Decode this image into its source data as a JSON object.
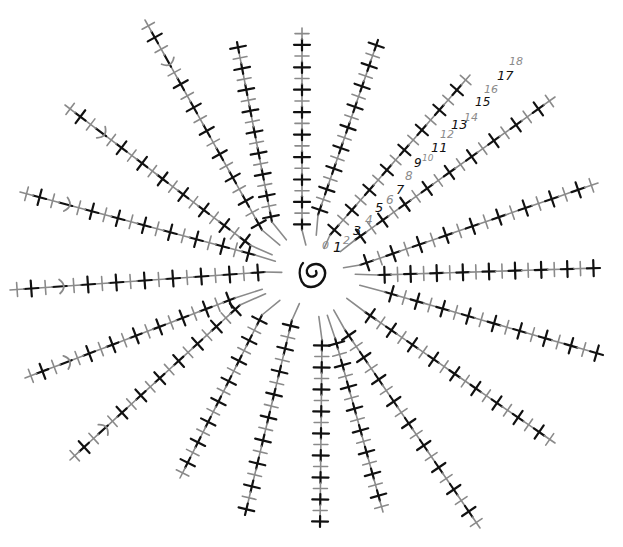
{
  "diagram": {
    "type": "crochet-chart",
    "center": {
      "x": 313,
      "y": 273,
      "symbol": "magic-ring"
    },
    "colors": {
      "odd_row": "#111111",
      "even_row": "#8a8a8a",
      "background": "#ffffff"
    },
    "row_labels": [
      {
        "text": "0",
        "x": 322,
        "y": 249,
        "size": 11,
        "row": 0
      },
      {
        "text": "1",
        "x": 333,
        "y": 252,
        "size": 14,
        "row": 1
      },
      {
        "text": "2",
        "x": 343,
        "y": 244,
        "size": 11,
        "row": 2
      },
      {
        "text": "3",
        "x": 353,
        "y": 235,
        "size": 13,
        "row": 3
      },
      {
        "text": "4",
        "x": 365,
        "y": 224,
        "size": 12,
        "row": 4
      },
      {
        "text": "5",
        "x": 375,
        "y": 212,
        "size": 13,
        "row": 5
      },
      {
        "text": "6",
        "x": 386,
        "y": 204,
        "size": 12,
        "row": 6
      },
      {
        "text": "7",
        "x": 396,
        "y": 194,
        "size": 13,
        "row": 7
      },
      {
        "text": "8",
        "x": 405,
        "y": 180,
        "size": 12,
        "row": 8
      },
      {
        "text": "9",
        "x": 414,
        "y": 167,
        "size": 12,
        "row": 9
      },
      {
        "text": "10",
        "x": 422,
        "y": 161,
        "size": 9,
        "row": 10
      },
      {
        "text": "11",
        "x": 431,
        "y": 152,
        "size": 13,
        "row": 11
      },
      {
        "text": "12",
        "x": 440,
        "y": 138,
        "size": 11,
        "row": 12
      },
      {
        "text": "13",
        "x": 451,
        "y": 129,
        "size": 13,
        "row": 13
      },
      {
        "text": "14",
        "x": 464,
        "y": 121,
        "size": 11,
        "row": 14
      },
      {
        "text": "15",
        "x": 475,
        "y": 106,
        "size": 12,
        "row": 15
      },
      {
        "text": "16",
        "x": 484,
        "y": 93,
        "size": 11,
        "row": 16
      },
      {
        "text": "17",
        "x": 497,
        "y": 80,
        "size": 13,
        "row": 17
      },
      {
        "text": "18",
        "x": 509,
        "y": 65,
        "size": 11,
        "row": 18
      }
    ],
    "spokes": [
      {
        "name": "spoke-nw-1",
        "x1": 262,
        "y1": 230,
        "x2": 145,
        "y2": 20,
        "stitches": 18,
        "chain_at": 15
      },
      {
        "name": "spoke-n-1",
        "x1": 272,
        "y1": 222,
        "x2": 237,
        "y2": 42,
        "stitches": 17
      },
      {
        "name": "spoke-n-2",
        "x1": 302,
        "y1": 230,
        "x2": 302,
        "y2": 28,
        "stitches": 18
      },
      {
        "name": "spoke-n-3",
        "x1": 318,
        "y1": 215,
        "x2": 378,
        "y2": 40,
        "stitches": 17
      },
      {
        "name": "spoke-ne-1",
        "x1": 330,
        "y1": 235,
        "x2": 470,
        "y2": 75,
        "stitches": 16
      },
      {
        "name": "spoke-ne-2",
        "x1": 355,
        "y1": 240,
        "x2": 555,
        "y2": 97,
        "stitches": 18
      },
      {
        "name": "spoke-e-1",
        "x1": 360,
        "y1": 265,
        "x2": 598,
        "y2": 183,
        "stitches": 18
      },
      {
        "name": "spoke-e-2",
        "x1": 378,
        "y1": 275,
        "x2": 600,
        "y2": 268,
        "stitches": 17
      },
      {
        "name": "spoke-e-3",
        "x1": 385,
        "y1": 292,
        "x2": 603,
        "y2": 355,
        "stitches": 17
      },
      {
        "name": "spoke-se-1",
        "x1": 365,
        "y1": 312,
        "x2": 555,
        "y2": 443,
        "stitches": 18
      },
      {
        "name": "spoke-se-2",
        "x1": 345,
        "y1": 330,
        "x2": 480,
        "y2": 528,
        "stitches": 18
      },
      {
        "name": "spoke-s-1",
        "x1": 335,
        "y1": 338,
        "x2": 383,
        "y2": 512,
        "stitches": 16
      },
      {
        "name": "spoke-s-2",
        "x1": 322,
        "y1": 340,
        "x2": 320,
        "y2": 527,
        "stitches": 17
      },
      {
        "name": "spoke-s-3",
        "x1": 292,
        "y1": 320,
        "x2": 245,
        "y2": 515,
        "stitches": 17
      },
      {
        "name": "spoke-sw-1",
        "x1": 262,
        "y1": 315,
        "x2": 180,
        "y2": 478,
        "stitches": 16
      },
      {
        "name": "spoke-sw-2",
        "x1": 240,
        "y1": 305,
        "x2": 70,
        "y2": 460,
        "stitches": 18,
        "chain_at": 15
      },
      {
        "name": "spoke-w-1",
        "x1": 235,
        "y1": 298,
        "x2": 25,
        "y2": 378,
        "stitches": 18,
        "chain_at": 15
      },
      {
        "name": "spoke-w-2",
        "x1": 265,
        "y1": 272,
        "x2": 10,
        "y2": 290,
        "stitches": 18,
        "chain_at": 15
      },
      {
        "name": "spoke-w-3",
        "x1": 255,
        "y1": 255,
        "x2": 20,
        "y2": 192,
        "stitches": 18,
        "chain_at": 15
      },
      {
        "name": "spoke-wnw-1",
        "x1": 250,
        "y1": 245,
        "x2": 65,
        "y2": 105,
        "stitches": 18,
        "chain_at": 15
      }
    ]
  }
}
